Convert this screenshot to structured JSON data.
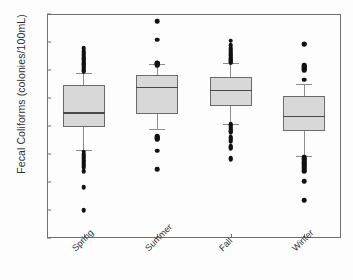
{
  "figure": {
    "background_color": "#fdfdfd",
    "frame_color": "#6f6f6f",
    "box_fill_color": "#d8d8d8",
    "box_edge_color": "#6a6a6a",
    "outlier_color": "#111111",
    "whisker_color": "#8d8d8d"
  },
  "axis": {
    "ylabel": "Fecal Coliforms (colonies/100mL)",
    "xlabel": "",
    "ytick_labels": [
      "10",
      "10",
      "10",
      "10",
      "10",
      "10",
      "10",
      "10",
      "10"
    ],
    "ytick_exponents": [
      "7",
      "6",
      "5",
      "4",
      "3",
      "2",
      "1",
      "0",
      "-1"
    ],
    "ytick_values": [
      10000000,
      1000000,
      100000,
      10000,
      1000,
      100,
      10,
      1,
      0.1
    ]
  },
  "chart_data": {
    "type": "box",
    "title": "",
    "xlabel": "",
    "ylabel": "Fecal Coliforms (colonies/100mL)",
    "yscale": "log",
    "ylim": [
      0.1,
      10000000
    ],
    "grid": false,
    "legend": "none",
    "categories": [
      "Spring",
      "Summer",
      "Fall",
      "Winter"
    ],
    "boxes": [
      {
        "label": "Spring",
        "whisker_high": 80000,
        "q3": 30000,
        "median": 3100,
        "q1": 950,
        "whisker_low": 140,
        "outliers_high": [
          600000,
          480000,
          420000,
          380000,
          340000,
          300000,
          270000,
          240000,
          215000,
          195000,
          175000,
          160000,
          145000,
          132000,
          120000,
          110000,
          100000,
          92000
        ],
        "outliers_low": [
          120,
          100,
          88,
          76,
          66,
          58,
          50,
          44,
          38,
          33,
          24,
          6.5,
          1.0
        ]
      },
      {
        "label": "Summer",
        "whisker_high": 170000,
        "q3": 68000,
        "median": 25000,
        "q1": 2700,
        "whisker_low": 800,
        "outliers_high": [
          5500000,
          1200000,
          185000,
          178000,
          172000,
          166000,
          160000,
          155000,
          150000
        ],
        "outliers_low": [
          430,
          400,
          375,
          350,
          330,
          130,
          28
        ]
      },
      {
        "label": "Fall",
        "whisker_high": 175000,
        "q3": 55000,
        "median": 20000,
        "q1": 5000,
        "whisker_low": 1200,
        "outliers_high": [
          1100000,
          780000,
          600000,
          500000,
          430000,
          375000,
          330000,
          295000,
          265000,
          240000,
          220000,
          205000,
          190000,
          182000
        ],
        "outliers_low": [
          1150,
          1050,
          950,
          870,
          790,
          720,
          660,
          600,
          410,
          380,
          350,
          320,
          290,
          190,
          175,
          160,
          72,
          66
        ]
      },
      {
        "label": "Winter",
        "whisker_high": 32000,
        "q3": 12000,
        "median": 2300,
        "q1": 650,
        "whisker_low": 85,
        "outliers_high": [
          880000,
          820000,
          145000,
          135000,
          125000,
          115000,
          105000,
          98000,
          45000
        ],
        "outliers_low": [
          80,
          72,
          65,
          58,
          52,
          47,
          42,
          38,
          34,
          30,
          27,
          24,
          10.5,
          2.2
        ]
      }
    ]
  }
}
